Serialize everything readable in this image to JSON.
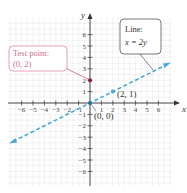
{
  "chart_data": {
    "type": "line",
    "title": "",
    "xlabel": "x",
    "ylabel": "y",
    "xlim": [
      -7,
      7
    ],
    "ylim": [
      -7,
      7
    ],
    "grid": true,
    "x_ticks": [
      -6,
      -5,
      -4,
      -3,
      -2,
      -1,
      1,
      2,
      3,
      4,
      5,
      6
    ],
    "y_ticks": [
      -6,
      -5,
      -4,
      -3,
      -2,
      -1,
      1,
      2,
      3,
      4,
      5,
      6
    ],
    "series": [
      {
        "name": "x = 2y",
        "style": "dashed",
        "color": "#4aa8d8",
        "x": [
          -7,
          7
        ],
        "y": [
          -3.5,
          3.5
        ]
      }
    ],
    "points": [
      {
        "label": "(0, 2)",
        "x": 0,
        "y": 2,
        "color": "#8b1a3a"
      },
      {
        "label": "(2, 1)",
        "x": 2,
        "y": 1,
        "color": "#4aa8d8"
      },
      {
        "label": "(0, 0)",
        "x": 0,
        "y": 0,
        "color": "#1f6f9a"
      }
    ],
    "annotations": [
      {
        "text": "Line:",
        "text2": "x = 2y",
        "points_to": [
          5.5,
          2.75
        ]
      },
      {
        "text": "Test point:",
        "text2": "(0, 2)",
        "points_to": [
          0,
          2
        ]
      }
    ]
  },
  "axes": {
    "x_label": "x",
    "y_label": "y"
  },
  "callouts": {
    "line": {
      "title": "Line:",
      "equation": "x = 2y"
    },
    "test_point": {
      "title": "Test point:",
      "coords": "(0, 2)"
    }
  },
  "point_labels": {
    "p21": "(2, 1)",
    "origin": "(0, 0)"
  },
  "colors": {
    "line": "#4aa8d8",
    "test_point": "#8b1a3a",
    "callout_pink": "#e07a9a",
    "grid": "#e6e6e6",
    "axis": "#333333"
  }
}
